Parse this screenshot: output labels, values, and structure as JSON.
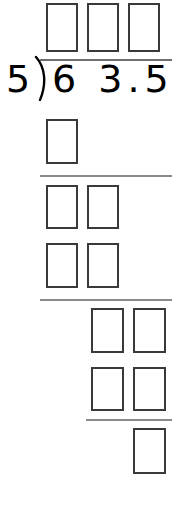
{
  "problem": {
    "type": "long-division-worksheet",
    "divisor": "5",
    "dividend": "6 3.5",
    "dividend_digits": [
      "6",
      "3",
      ".",
      "5"
    ],
    "bracket_glyph": ")",
    "quotient_boxes": 3,
    "total_answer_boxes": 10,
    "separator_rules": 3,
    "colors": {
      "ink": "#000000",
      "box_border": "#3a3a3a",
      "rule": "#8a8a8a",
      "background": "#ffffff"
    }
  },
  "quotient_row": {
    "label": "quotient-answer-boxes",
    "boxes": [
      {
        "value": "",
        "x": 46,
        "y": 3,
        "w": 32,
        "h": 49
      },
      {
        "value": "",
        "x": 87,
        "y": 3,
        "w": 32,
        "h": 49
      },
      {
        "value": "",
        "x": 128,
        "y": 3,
        "w": 32,
        "h": 49
      }
    ]
  },
  "work_rows": [
    {
      "label": "step-1-product-row",
      "boxes": [
        {
          "value": "",
          "x": 46,
          "y": 119,
          "w": 32,
          "h": 45
        }
      ]
    },
    {
      "label": "step-1-remainder-row",
      "boxes": [
        {
          "value": "",
          "x": 46,
          "y": 185,
          "w": 32,
          "h": 44
        },
        {
          "value": "",
          "x": 87,
          "y": 185,
          "w": 32,
          "h": 44
        }
      ]
    },
    {
      "label": "step-2-product-row",
      "boxes": [
        {
          "value": "",
          "x": 46,
          "y": 243,
          "w": 32,
          "h": 45
        },
        {
          "value": "",
          "x": 87,
          "y": 243,
          "w": 32,
          "h": 45
        }
      ]
    },
    {
      "label": "step-2-remainder-row",
      "boxes": [
        {
          "value": "",
          "x": 91,
          "y": 308,
          "w": 33,
          "h": 45
        },
        {
          "value": "",
          "x": 133,
          "y": 308,
          "w": 33,
          "h": 45
        }
      ]
    },
    {
      "label": "step-3-product-row",
      "boxes": [
        {
          "value": "",
          "x": 91,
          "y": 367,
          "w": 33,
          "h": 44
        },
        {
          "value": "",
          "x": 133,
          "y": 367,
          "w": 33,
          "h": 44
        }
      ]
    },
    {
      "label": "final-remainder-row",
      "boxes": [
        {
          "value": "",
          "x": 133,
          "y": 428,
          "w": 33,
          "h": 46
        }
      ]
    }
  ],
  "rules": [
    {
      "label": "vinculum",
      "x": 40,
      "y": 59,
      "w": 132
    },
    {
      "label": "subtraction-rule-1",
      "x": 40,
      "y": 175,
      "w": 132
    },
    {
      "label": "subtraction-rule-2",
      "x": 40,
      "y": 299,
      "w": 132
    },
    {
      "label": "subtraction-rule-3",
      "x": 86,
      "y": 419,
      "w": 86
    }
  ]
}
